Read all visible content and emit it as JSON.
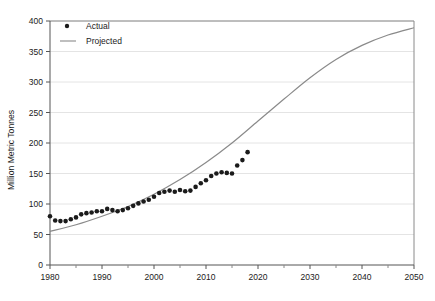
{
  "chart_data": {
    "type": "scatter",
    "title": "",
    "xlabel": "",
    "ylabel": "Million Metric Tonnes",
    "xlim": [
      1980,
      2050
    ],
    "ylim": [
      0,
      400
    ],
    "grid": true,
    "legend_position": "top-left-inside",
    "y_ticks": [
      0,
      50,
      100,
      150,
      200,
      250,
      300,
      350,
      400
    ],
    "y_tick_labels": [
      "0",
      "50",
      "100",
      "150",
      "200",
      "250",
      "300",
      "350",
      "400"
    ],
    "x_ticks": [
      1980,
      1990,
      2000,
      2010,
      2020,
      2030,
      2040,
      2050
    ],
    "x_tick_labels": [
      "1980",
      "1990",
      "2000",
      "2010",
      "2020",
      "2030",
      "2040",
      "2050"
    ],
    "x_minor_ticks": [
      1985,
      1995,
      2005,
      2015,
      2025,
      2035,
      2045
    ],
    "colors": {
      "actual_marker": "#1b1b1b",
      "projected_line": "#8a8a8a",
      "gridline": "#e4e4e4",
      "axis": "#8a8a8a",
      "background": "#ffffff"
    },
    "series": [
      {
        "name": "Actual",
        "type": "scatter",
        "marker": "circle",
        "x": [
          1980,
          1981,
          1982,
          1983,
          1984,
          1985,
          1986,
          1987,
          1988,
          1989,
          1990,
          1991,
          1992,
          1993,
          1994,
          1995,
          1996,
          1997,
          1998,
          1999,
          2000,
          2001,
          2002,
          2003,
          2004,
          2005,
          2006,
          2007,
          2008,
          2009,
          2010,
          2011,
          2012,
          2013,
          2014,
          2015,
          2016,
          2017,
          2018
        ],
        "values": [
          80,
          73,
          72,
          72,
          75,
          78,
          83,
          85,
          86,
          88,
          88,
          92,
          90,
          88,
          90,
          93,
          97,
          101,
          104,
          107,
          112,
          118,
          120,
          122,
          120,
          123,
          121,
          122,
          128,
          134,
          139,
          146,
          150,
          152,
          151,
          150,
          163,
          172,
          185
        ]
      },
      {
        "name": "Projected",
        "type": "line",
        "x": [
          1980,
          1985,
          1990,
          1995,
          2000,
          2005,
          2010,
          2015,
          2020,
          2025,
          2030,
          2035,
          2040,
          2045,
          2050
        ],
        "values": [
          55,
          66,
          80,
          96,
          116,
          140,
          168,
          200,
          236,
          272,
          307,
          337,
          360,
          377,
          389
        ]
      }
    ],
    "annotations": []
  },
  "legend": {
    "items": [
      {
        "label": "Actual",
        "marker": "dot-marker"
      },
      {
        "label": "Projected",
        "marker": "line-marker"
      }
    ]
  }
}
